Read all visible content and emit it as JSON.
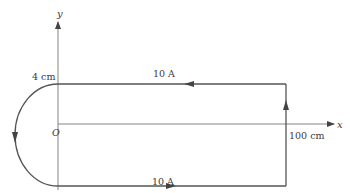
{
  "diagram": {
    "axes": {
      "x_label": "x",
      "y_label": "y",
      "origin_label": "O"
    },
    "labels": {
      "radius": "4 cm",
      "current_top": "10 A",
      "current_bottom": "10 A",
      "length": "100 cm"
    },
    "colors": {
      "wire": "#555555",
      "axis": "#777777",
      "text": "#3a3a3a"
    }
  }
}
